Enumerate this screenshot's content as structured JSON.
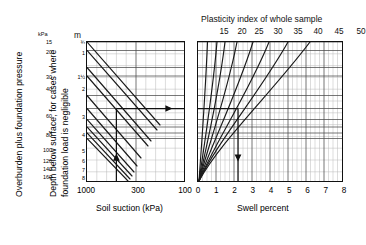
{
  "figure": {
    "left_axis_caption": "Overburden plus foundation pressure",
    "left_axis_caption2_line1": "Depth below surface, for cases where",
    "left_axis_caption2_line2": "foundation load is negligible",
    "kpa_unit": "kPa",
    "m_unit": "m",
    "bottom_left_title": "Soil suction (kPa)",
    "bottom_right_title": "Swell percent",
    "top_right_title": "Plasticity index of whole sample"
  },
  "chart_data": {
    "type": "line",
    "title": "Plasticity index of whole sample",
    "subtitle": "",
    "panels": [
      {
        "name": "soil-suction-panel",
        "xlabel": "Soil suction (kPa)",
        "ylabel": "Depth below surface, for cases where foundation load is negligible",
        "xscale": "log-reversed",
        "xlim": [
          1000,
          100
        ],
        "xticks": [
          1000,
          300,
          100
        ],
        "xtick_labels": [
          "1000",
          "300",
          "100"
        ],
        "ylabel_secondary": "Overburden plus foundation pressure",
        "y_kpa_ticks": [
          15,
          20,
          30,
          40,
          60,
          80,
          100,
          120,
          140,
          160
        ],
        "y_kpa_unit": "kPa",
        "y_m_ticks": [
          "¾",
          "1",
          "1½",
          "2",
          "3",
          "4",
          "5",
          "6",
          "7",
          "8"
        ],
        "y_m_unit": "m",
        "grid": true,
        "series": [
          {
            "name": "depth-line-0.75m",
            "y_level": "¾"
          },
          {
            "name": "depth-line-1m",
            "y_level": "1"
          },
          {
            "name": "depth-line-1.5m",
            "y_level": "1½"
          },
          {
            "name": "depth-line-2m",
            "y_level": "2"
          },
          {
            "name": "depth-line-3m",
            "y_level": "3"
          },
          {
            "name": "depth-line-4m",
            "y_level": "4"
          },
          {
            "name": "depth-line-5m",
            "y_level": "5"
          },
          {
            "name": "depth-line-6m",
            "y_level": "6"
          },
          {
            "name": "depth-line-7m",
            "y_level": "7"
          },
          {
            "name": "depth-line-8m",
            "y_level": "8"
          }
        ]
      },
      {
        "name": "swell-percent-panel",
        "xlabel": "Swell percent",
        "xscale": "linear",
        "xlim": [
          0,
          8
        ],
        "xticks": [
          0,
          1,
          2,
          3,
          4,
          5,
          6,
          7,
          8
        ],
        "xtick_labels": [
          "0",
          "1",
          "2",
          "3",
          "4",
          "5",
          "6",
          "7",
          "8"
        ],
        "grid": true,
        "legend_position": "top",
        "legend_title": "Plasticity index of whole sample",
        "series": [
          {
            "name": "pi-15",
            "label": "15"
          },
          {
            "name": "pi-20",
            "label": "20"
          },
          {
            "name": "pi-25",
            "label": "25"
          },
          {
            "name": "pi-30",
            "label": "30"
          },
          {
            "name": "pi-35",
            "label": "35"
          },
          {
            "name": "pi-40",
            "label": "40"
          },
          {
            "name": "pi-45",
            "label": "45"
          },
          {
            "name": "pi-50",
            "label": "50"
          }
        ]
      }
    ],
    "annotations": [
      {
        "name": "suction-entry-arrow",
        "type": "arrow-up",
        "panel": "soil-suction-panel",
        "x_value": "200"
      },
      {
        "name": "transfer-arrow",
        "type": "arrow-right",
        "panel": "soil-suction-panel",
        "y_level": "4"
      },
      {
        "name": "swell-exit-arrow",
        "type": "arrow-down",
        "panel": "swell-percent-panel",
        "x_value": "2.2"
      }
    ]
  },
  "axes": {
    "kpa_ticks": [
      {
        "label": "15",
        "pos": 0.0
      },
      {
        "label": "20",
        "pos": 7.5
      },
      {
        "label": "30",
        "pos": 25.0
      },
      {
        "label": "40",
        "pos": 33.5
      },
      {
        "label": "60",
        "pos": 53.0
      },
      {
        "label": "80",
        "pos": 66.0
      },
      {
        "label": "100",
        "pos": 77.0
      },
      {
        "label": "120",
        "pos": 84.5
      },
      {
        "label": "140",
        "pos": 90.5
      },
      {
        "label": "160",
        "pos": 96.0
      }
    ],
    "m_ticks": [
      {
        "label": "¾",
        "pos": 0.0
      },
      {
        "label": "1",
        "pos": 8.5
      },
      {
        "label": "1½",
        "pos": 25.5
      },
      {
        "label": "2",
        "pos": 34.0
      },
      {
        "label": "3",
        "pos": 53.5
      },
      {
        "label": "4",
        "pos": 66.5
      },
      {
        "label": "5",
        "pos": 77.5
      },
      {
        "label": "6",
        "pos": 85.0
      },
      {
        "label": "7",
        "pos": 91.0
      },
      {
        "label": "8",
        "pos": 96.5
      }
    ],
    "left_xticks": [
      {
        "label": "1000",
        "pos": 0
      },
      {
        "label": "300",
        "pos": 52
      },
      {
        "label": "100",
        "pos": 99
      }
    ],
    "right_xticks": [
      {
        "label": "0",
        "pos": 0
      },
      {
        "label": "1",
        "pos": 18.25
      },
      {
        "label": "2",
        "pos": 36.5
      },
      {
        "label": "3",
        "pos": 54.75
      },
      {
        "label": "4",
        "pos": 73
      },
      {
        "label": "5",
        "pos": 91.25
      },
      {
        "label": "6",
        "pos": 109.5
      },
      {
        "label": "7",
        "pos": 127.75
      },
      {
        "label": "8",
        "pos": 146
      }
    ],
    "pi_labels": [
      {
        "label": "15",
        "pos": 26
      },
      {
        "label": "20",
        "pos": 44
      },
      {
        "label": "25",
        "pos": 61
      },
      {
        "label": "30",
        "pos": 80
      },
      {
        "label": "35",
        "pos": 100
      },
      {
        "label": "40",
        "pos": 120
      },
      {
        "label": "45",
        "pos": 141
      },
      {
        "label": "50",
        "pos": 163
      }
    ]
  }
}
